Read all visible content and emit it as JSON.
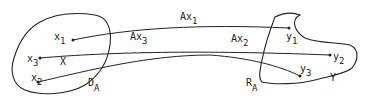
{
  "diagram": {
    "domain_region": {
      "label": "D",
      "subscript": "A",
      "set_label": "X"
    },
    "range_region": {
      "label": "R",
      "subscript": "A",
      "set_label": "Y"
    },
    "points_x": [
      {
        "name": "x",
        "sub": "1"
      },
      {
        "name": "x",
        "sub": "2"
      },
      {
        "name": "x",
        "sub": "3"
      }
    ],
    "points_y": [
      {
        "name": "y",
        "sub": "1"
      },
      {
        "name": "y",
        "sub": "2"
      },
      {
        "name": "y",
        "sub": "3"
      }
    ],
    "arrows": [
      {
        "name": "Ax",
        "sub": "1",
        "from": "x1",
        "to": "y1"
      },
      {
        "name": "Ax",
        "sub": "2",
        "from": "x2",
        "to": "y3"
      },
      {
        "name": "Ax",
        "sub": "3",
        "from": "x3",
        "to": "y2"
      }
    ],
    "colors": {
      "stroke": "#222222",
      "background": "#ffffff"
    }
  }
}
